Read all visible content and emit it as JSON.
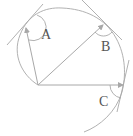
{
  "diagram": {
    "type": "geometry",
    "labels": {
      "A": "A",
      "B": "B",
      "C": "C"
    },
    "colors": {
      "stroke": "#a8a8a8",
      "text": "#555555",
      "background": "#ffffff"
    },
    "points": {
      "origin": [
        38,
        85
      ],
      "A": [
        26,
        27
      ],
      "B": [
        104,
        24
      ],
      "C": [
        124,
        85
      ]
    }
  }
}
